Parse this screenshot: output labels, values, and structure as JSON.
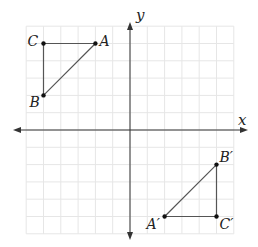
{
  "diagram": {
    "type": "coordinate-plane-transformation",
    "grid": {
      "xmin": -6,
      "xmax": 6,
      "ymin": -6,
      "ymax": 6,
      "unit_px": 17.3,
      "origin_px": [
        130,
        130
      ]
    },
    "axes": {
      "x_label": "x",
      "y_label": "y"
    },
    "colors": {
      "grid": "#e6e6e6",
      "axis": "#333333",
      "triangle": "#555555",
      "point": "#111111",
      "label": "#222222"
    },
    "triangles": [
      {
        "name": "original",
        "points": [
          {
            "label": "A",
            "x": -2,
            "y": 5,
            "label_dx": 4,
            "label_dy": 2
          },
          {
            "label": "B",
            "x": -5,
            "y": 2,
            "label_dx": -14,
            "label_dy": 12
          },
          {
            "label": "C",
            "x": -5,
            "y": 5,
            "label_dx": -16,
            "label_dy": 2
          }
        ]
      },
      {
        "name": "image",
        "points": [
          {
            "label": "A′",
            "x": 2,
            "y": -5,
            "label_dx": -18,
            "label_dy": 12
          },
          {
            "label": "B′",
            "x": 5,
            "y": -2,
            "label_dx": 3,
            "label_dy": -3
          },
          {
            "label": "C′",
            "x": 5,
            "y": -5,
            "label_dx": 3,
            "label_dy": 12
          }
        ]
      }
    ]
  }
}
